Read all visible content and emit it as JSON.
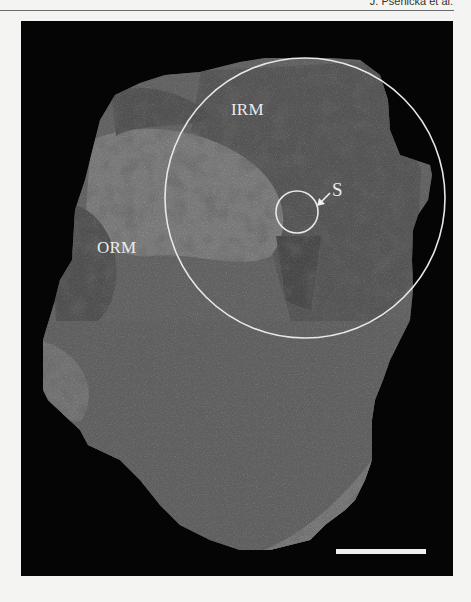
{
  "header": {
    "running_title": "J. Pšenička et al."
  },
  "figure": {
    "type": "photograph",
    "background_color": "#050505",
    "annotations": {
      "labels": [
        {
          "id": "irm",
          "text": "IRM"
        },
        {
          "id": "orm",
          "text": "ORM"
        },
        {
          "id": "s",
          "text": "S"
        }
      ],
      "large_circle": {
        "cx": 284,
        "cy": 177,
        "r": 140,
        "color": "#e8e8e8"
      },
      "small_circle": {
        "cx": 276,
        "cy": 191,
        "r": 21,
        "color": "#e8e8e8"
      },
      "arrow": {
        "from": [
          309,
          172
        ],
        "to": [
          298,
          183
        ],
        "points_to": "S"
      },
      "scale_bar": {
        "x1": 315,
        "x2": 405,
        "y": 530,
        "color": "#f0f0f0"
      }
    },
    "colors": {
      "light_region": "#8c8c8c",
      "mid_region": "#5e5e5e",
      "dark_region": "#343434"
    }
  }
}
